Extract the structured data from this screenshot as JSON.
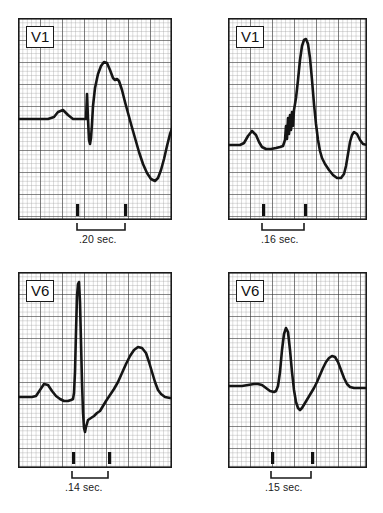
{
  "figure": {
    "type": "ecg-strip-grid",
    "background": "#ffffff",
    "ink_color": "#1a1a1a",
    "grid_minor_color": "#8d8d8d",
    "grid_major_color": "#2b2b2b",
    "caption_text": "",
    "panel_count": 4
  },
  "panels": [
    {
      "id": "panel-top-left",
      "lead_label": "V1",
      "interval_label": ".20 sec.",
      "interval_seconds": 0.2,
      "position": {
        "x": 18,
        "y": 18,
        "width": 154,
        "height": 202
      },
      "label_position": {
        "x": 26,
        "y": 26
      },
      "bracket": {
        "x1": 78,
        "x2": 126,
        "y": 228
      },
      "tick_marks": [
        78,
        126
      ],
      "interval_label_position": {
        "x": 79,
        "y": 234
      },
      "baseline_y": 0.5,
      "description": "Small P wave, sharp narrow QS deflection, tall notched R wave, deep inverted T wave"
    },
    {
      "id": "panel-top-right",
      "lead_label": "V1",
      "interval_label": ".16 sec.",
      "interval_seconds": 0.16,
      "position": {
        "x": 228,
        "y": 18,
        "width": 139,
        "height": 202
      },
      "label_position": {
        "x": 236,
        "y": 26
      },
      "bracket": {
        "x1": 263,
        "x2": 305,
        "y": 228
      },
      "tick_marks": [
        263,
        305
      ],
      "interval_label_position": {
        "x": 263,
        "y": 234
      },
      "baseline_y": 0.62,
      "description": "Low P wave, notched slurred upstroke (delta wave), very tall narrow R, deep S and inverted T"
    },
    {
      "id": "panel-bottom-left",
      "lead_label": "V6",
      "interval_label": ".14 sec.",
      "interval_seconds": 0.14,
      "position": {
        "x": 18,
        "y": 272,
        "width": 154,
        "height": 196
      },
      "label_position": {
        "x": 26,
        "y": 280
      },
      "bracket": {
        "x1": 74,
        "x2": 110,
        "y": 474
      },
      "tick_marks": [
        74,
        110
      ],
      "interval_label_position": {
        "x": 66,
        "y": 480
      },
      "baseline_y": 0.62,
      "description": "P wave, extremely tall thin R spike reaching top of strip, deep narrow S, broad upright T wave"
    },
    {
      "id": "panel-bottom-right",
      "lead_label": "V6",
      "interval_label": ".15 sec.",
      "interval_seconds": 0.15,
      "position": {
        "x": 228,
        "y": 272,
        "width": 139,
        "height": 196
      },
      "label_position": {
        "x": 236,
        "y": 280
      },
      "bracket": {
        "x1": 272,
        "x2": 312,
        "y": 474
      },
      "tick_marks": [
        272,
        312
      ],
      "interval_label_position": {
        "x": 266,
        "y": 480
      },
      "baseline_y": 0.58,
      "description": "Flat P, narrow tall R spike, small S dip, broad rounded upright T wave"
    }
  ],
  "chart_data": {
    "type": "line",
    "title": "",
    "xlabel": "",
    "ylabel": "",
    "grid": true,
    "series": [
      {
        "name": "panel-top-left-V1",
        "lead": "V1",
        "interval_sec": 0.2,
        "points": "M0,101 L30,101 L36,99 L40,94 L45,92 L50,97 L55,101 L62,101 L66,101 L68,101 L69,76 L70,101 L71,122 L72,126 L73,120 L74,106 L75,88 L77,70 L80,56 L83,48 L86,44 L89,45 L92,52 L95,60 L97,62 L99,61 L101,63 L104,72 L107,84 L110,95 L113,106 L117,120 L121,134 L125,146 L129,155 L133,161 L137,163 L140,160 L143,152 L146,141 L149,128 L152,116 L155,108 L158,103 L161,100 L164,100 L168,101 L174,101"
      },
      {
        "name": "panel-top-right-V1",
        "lead": "V1",
        "interval_sec": 0.16,
        "points": "M0,127 L12,127 L16,125 L20,118 L24,113 L28,117 L31,124 L34,129 L38,131 L43,131 L48,130 L52,129 L55,128 L57,122 L58,108 L59,121 L60,100 L61,116 L62,97 L63,112 L64,94 L65,108 L66,92 L68,80 L70,62 L72,42 L74,28 L76,22 L78,21 L80,26 L82,40 L84,62 L86,86 L88,106 L90,122 L92,133 L94,140 L97,146 L101,152 L105,157 L109,160 L113,160 L116,156 L118,148 L120,136 L122,124 L124,117 L126,114 L129,116 L132,122 L135,126 L139,127 L145,127 L152,127"
      },
      {
        "name": "panel-bottom-left-V6",
        "lead": "V6",
        "interval_sec": 0.14,
        "points": "M0,125 L14,125 L18,124 L22,118 L26,112 L30,113 L34,119 L38,124 L42,127 L46,129 L50,129 L53,128 L55,127 L56,121 L57,100 L58,60 L59,24 L60,12 L61,10 L62,30 L63,70 L64,110 L65,140 L66,156 L67,160 L68,155 L70,148 L73,146 L76,144 L79,141 L82,139 L85,134 L88,129 L92,123 L96,117 L100,110 L104,101 L108,92 L112,84 L116,78 L120,75 L124,76 L128,81 L131,90 L134,100 L137,110 L140,118 L143,122 L147,125 L152,126 L158,126 L165,126"
      },
      {
        "name": "panel-bottom-right-V6",
        "lead": "V6",
        "interval_sec": 0.15,
        "points": "M0,114 L14,114 L20,113 L26,112 L30,112 L34,113 L38,116 L42,119 L46,120 L48,119 L50,114 L52,100 L54,78 L56,62 L58,56 L60,60 L62,78 L64,100 L66,118 L68,130 L70,136 L72,138 L74,136 L77,131 L80,126 L83,121 L86,116 L89,110 L92,103 L95,96 L98,90 L101,86 L104,84 L107,85 L110,90 L113,98 L116,106 L119,112 L122,115 L126,116 L131,116 L138,116 L146,116"
      }
    ]
  }
}
